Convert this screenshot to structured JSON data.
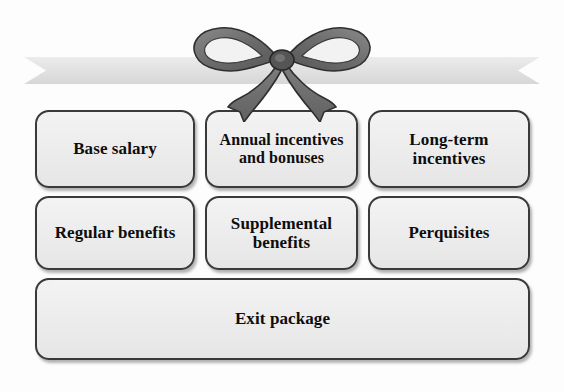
{
  "diagram": {
    "type": "grouped-boxes-with-ribbon-bow",
    "background_color": "#fdfdfd",
    "box_fill_color": "#eeeeee",
    "box_border_color": "#3a3a3a",
    "text_color": "#0d0d0d",
    "ribbon_color": "#e2e2e2",
    "bow_color": "#6e6e6e",
    "ornament": {
      "ribbon_band_name": "ribbon-band",
      "bow_name": "ribbon-bow",
      "band_ends": "v-notched"
    },
    "rows": [
      {
        "row_index": 1,
        "boxes": [
          {
            "id": "base-salary",
            "label": "Base salary"
          },
          {
            "id": "annual-incentives",
            "label": "Annual incentives and bonuses"
          },
          {
            "id": "long-term-incentives",
            "label": "Long-term incentives"
          }
        ]
      },
      {
        "row_index": 2,
        "boxes": [
          {
            "id": "regular-benefits",
            "label": "Regular benefits"
          },
          {
            "id": "supplemental-benefits",
            "label": "Supplemental benefits"
          },
          {
            "id": "perquisites",
            "label": "Perquisites"
          }
        ]
      },
      {
        "row_index": 3,
        "boxes": [
          {
            "id": "exit-package",
            "label": "Exit package"
          }
        ]
      }
    ]
  }
}
